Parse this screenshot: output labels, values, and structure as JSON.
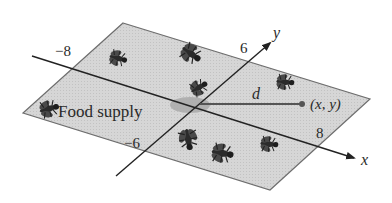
{
  "diagram": {
    "plane": {
      "fill": "#d4d4d4",
      "stroke": "#6e6e6e",
      "corners": [
        [
          123,
          23
        ],
        [
          370,
          99
        ],
        [
          270,
          190
        ],
        [
          23,
          113
        ]
      ]
    },
    "axes": {
      "x": {
        "label": "x",
        "ticks": [
          {
            "text": "−8"
          },
          {
            "text": "8"
          }
        ]
      },
      "y": {
        "label": "y",
        "ticks": [
          {
            "text": "6"
          },
          {
            "text": "−6"
          }
        ]
      }
    },
    "food_supply": {
      "label": "Food supply",
      "color": "#a8a8a8"
    },
    "distance": {
      "label": "d"
    },
    "point": {
      "label": "(x, y)"
    },
    "bugs": [
      {
        "name": "fly",
        "x": 117,
        "y": 58
      },
      {
        "name": "fly",
        "x": 190,
        "y": 53
      },
      {
        "name": "fly",
        "x": 198,
        "y": 88
      },
      {
        "name": "fly",
        "x": 284,
        "y": 82
      },
      {
        "name": "fly",
        "x": 48,
        "y": 109
      },
      {
        "name": "fly",
        "x": 188,
        "y": 138
      },
      {
        "name": "fly",
        "x": 221,
        "y": 153
      },
      {
        "name": "fly",
        "x": 268,
        "y": 144
      }
    ]
  }
}
